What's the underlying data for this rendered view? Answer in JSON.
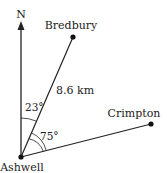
{
  "diagram": {
    "type": "bearing-diagram",
    "north_label": "N",
    "points": {
      "origin": {
        "name": "Ashwell",
        "x": 21,
        "y": 157
      },
      "p1": {
        "name": "Bredbury",
        "x": 73,
        "y": 37
      },
      "p2": {
        "name": "Crimpton",
        "x": 151,
        "y": 124
      }
    },
    "distance_label": "8.6 km",
    "angles": {
      "north_to_bredbury": "23°",
      "bredbury_to_crimpton": "75°"
    },
    "colors": {
      "line": "#222222",
      "text": "#222222",
      "background": "#ffffff"
    }
  }
}
